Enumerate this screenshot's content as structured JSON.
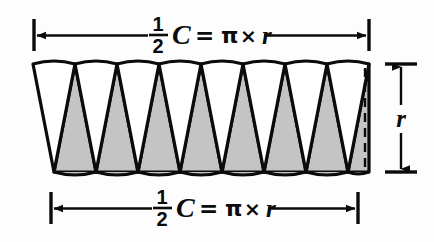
{
  "figure": {
    "background_color": "#fdfdfd",
    "ink_color": "#0b0b0b",
    "wedge_fill_gray": "#c4c4c4",
    "wedge_fill_white": "#ffffff"
  },
  "labels": {
    "top": {
      "fraction_numerator": "1",
      "fraction_denominator": "2",
      "circumference_symbol": "C",
      "equals": "=",
      "pi": "π",
      "times": "×",
      "radius_symbol": "r"
    },
    "bottom": {
      "fraction_numerator": "1",
      "fraction_denominator": "2",
      "circumference_symbol": "C",
      "equals": "=",
      "pi": "π",
      "times": "×",
      "radius_symbol": "r"
    },
    "right": {
      "radius_symbol": "r"
    }
  },
  "diagram": {
    "wedge_count_total": 16,
    "wedge_count_up": 8,
    "wedge_count_down": 8,
    "band_left": 33,
    "band_right": 369,
    "band_top": 62,
    "band_bottom": 172,
    "dashed_radius_line": true
  }
}
